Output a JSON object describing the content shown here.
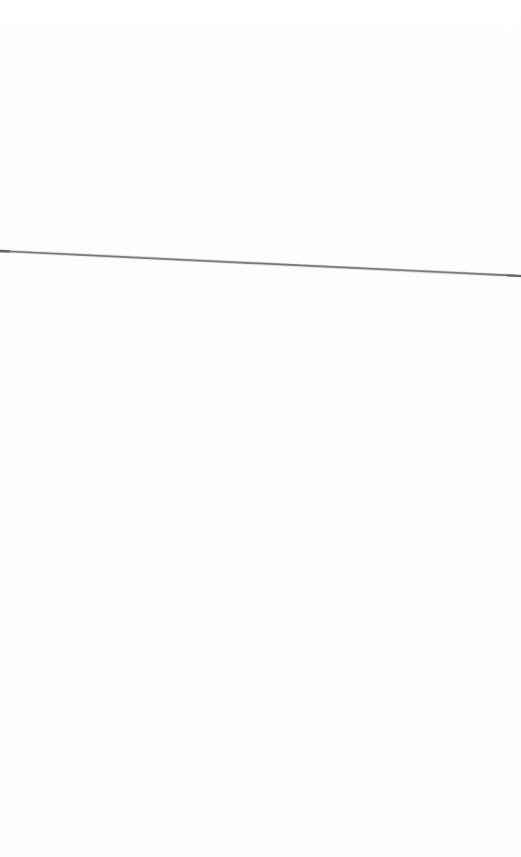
{
  "page": {
    "width": 521,
    "height": 857,
    "background_color": "#fdfdfd",
    "content_description": "A single near-horizontal thin grey scanned rule crossing the otherwise blank white page",
    "text_content": ""
  },
  "rule": {
    "name": "horizontal-rule",
    "color": "#76767a",
    "cap_color": "#5f5f64",
    "halo_color": "#b9b9bd",
    "stroke_width": 1.7,
    "x1": 0,
    "y1": 251,
    "x2": 521,
    "y2": 276,
    "angle_degrees": 2.5,
    "cap_style": "round"
  },
  "grain": {
    "name": "paper-grain",
    "opacity": 1,
    "description": "faint scanner noise specks over the white paper"
  }
}
